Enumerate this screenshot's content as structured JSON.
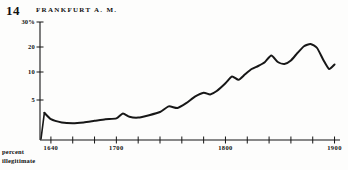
{
  "figure": {
    "number": "14",
    "title": "FRANKFURT a. M."
  },
  "axis_caption": {
    "line1": "percent",
    "line2": "illegitimate"
  },
  "chart_data": {
    "type": "line",
    "title": "FRANKFURT a. M.",
    "xlabel": "",
    "ylabel": "percent illegitimate",
    "grid": false,
    "legend": null,
    "xlim": [
      1630,
      1905
    ],
    "ylim": [
      0,
      30
    ],
    "y_tick_labels": [
      "30%",
      "20",
      "10",
      "5"
    ],
    "y_ticks": [
      30,
      20,
      10,
      5
    ],
    "x_tick_labels": [
      "1640",
      "1700",
      "1800",
      "1900"
    ],
    "x_ticks": [
      1640,
      1700,
      1800,
      1900
    ],
    "x_minor_ticks": [
      1660,
      1680,
      1720,
      1740,
      1760,
      1780,
      1820,
      1840,
      1860,
      1880
    ],
    "series": [
      {
        "name": "percent illegitimate",
        "x": [
          1634,
          1640,
          1650,
          1660,
          1670,
          1680,
          1690,
          1700,
          1706,
          1712,
          1720,
          1730,
          1740,
          1748,
          1756,
          1764,
          1772,
          1780,
          1786,
          1792,
          1800,
          1806,
          1812,
          1818,
          1824,
          1830,
          1836,
          1842,
          1848,
          1854,
          1860,
          1866,
          1872,
          1878,
          1884,
          1890,
          1895,
          1900
        ],
        "y": [
          3.4,
          2.6,
          2.2,
          2.1,
          2.2,
          2.4,
          2.6,
          2.7,
          3.3,
          2.9,
          2.8,
          3.1,
          3.5,
          4.2,
          4.0,
          4.6,
          5.6,
          6.3,
          6.0,
          6.6,
          8.0,
          9.2,
          8.6,
          9.6,
          11.2,
          12.4,
          13.9,
          16.6,
          14.0,
          13.2,
          14.6,
          17.6,
          20.3,
          21.2,
          19.6,
          14.6,
          11.2,
          13.0
        ]
      }
    ]
  }
}
